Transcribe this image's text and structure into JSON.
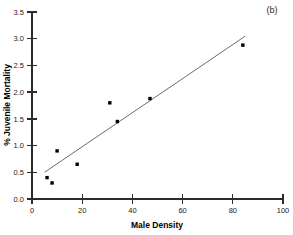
{
  "panel": {
    "label": "(b)"
  },
  "chart_data": {
    "type": "scatter",
    "title": "",
    "subtitle": "",
    "xlabel": "Male Density",
    "ylabel": "% Juvenile Mortality",
    "xlim": [
      0,
      100
    ],
    "ylim": [
      0.0,
      3.5
    ],
    "xticks": [
      0,
      20,
      40,
      60,
      80,
      100
    ],
    "xtick_labels": [
      "0",
      "20",
      "40",
      "60",
      "80",
      "100"
    ],
    "yticks": [
      0.0,
      0.5,
      1.0,
      1.5,
      2.0,
      2.5,
      3.0,
      3.5
    ],
    "ytick_labels": [
      "0.0",
      "0.5",
      "1.0",
      "1.5",
      "2.0",
      "2.5",
      "3.0",
      "3.5"
    ],
    "grid": false,
    "legend": false,
    "legend_position": "none",
    "marker_style": "filled-square",
    "marker_color": "#000000",
    "line_color": "#5a5a5a",
    "axis_color": "#2b2b2b",
    "series": [
      {
        "name": "observations",
        "type": "scatter",
        "x": [
          6,
          8,
          10,
          18,
          31,
          34,
          47,
          84
        ],
        "y": [
          0.4,
          0.3,
          0.9,
          0.65,
          1.8,
          1.45,
          1.88,
          2.88
        ]
      },
      {
        "name": "regression-line",
        "type": "line",
        "x": [
          5,
          85
        ],
        "y": [
          0.5,
          3.05
        ]
      }
    ],
    "annotations": [
      {
        "text": "(b)",
        "x_px": 272,
        "y_px": 12
      }
    ]
  }
}
